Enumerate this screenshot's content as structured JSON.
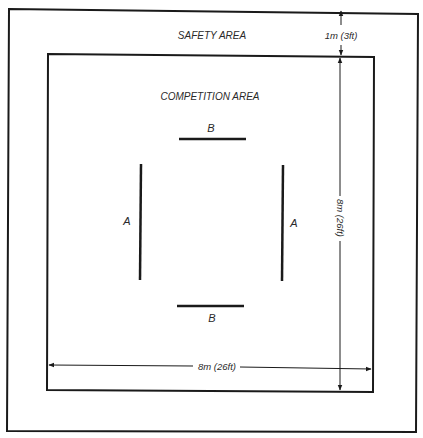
{
  "diagram": {
    "labels": {
      "safety_area": "SAFETY AREA",
      "competition_area": "COMPETITION AREA",
      "safety_width": "1m (3ft)",
      "competition_height": "8m (26ft)",
      "competition_width": "8m (26ft)",
      "line_a_left": "A",
      "line_a_right": "A",
      "line_b_top": "B",
      "line_b_bottom": "B"
    },
    "colors": {
      "line": "#1a1a1a",
      "background": "#ffffff"
    }
  }
}
